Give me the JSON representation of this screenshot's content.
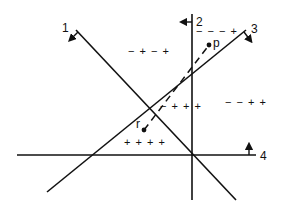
{
  "diagram": {
    "type": "line-arrangement",
    "colors": {
      "stroke": "#111111",
      "background": "#ffffff"
    },
    "lines": [
      {
        "id": "1",
        "label": "1",
        "x1": 76,
        "y1": 30,
        "x2": 236,
        "y2": 200,
        "label_x": 62,
        "label_y": 32,
        "arrow": "down-left"
      },
      {
        "id": "2",
        "label": "2",
        "x1": 192,
        "y1": 14,
        "x2": 192,
        "y2": 200,
        "label_x": 196,
        "label_y": 26,
        "arrow": "left"
      },
      {
        "id": "3",
        "label": "3",
        "x1": 47,
        "y1": 192,
        "x2": 246,
        "y2": 30,
        "label_x": 251,
        "label_y": 33,
        "arrow": "down-right"
      },
      {
        "id": "4",
        "label": "4",
        "x1": 17,
        "y1": 155,
        "x2": 256,
        "y2": 155,
        "label_x": 260,
        "label_y": 160,
        "arrow": "up"
      }
    ],
    "points": [
      {
        "id": "p",
        "label": "p",
        "x": 209,
        "y": 45,
        "label_x": 213,
        "label_y": 47
      },
      {
        "id": "r",
        "label": "r",
        "x": 144,
        "y": 130,
        "label_x": 136,
        "label_y": 128
      }
    ],
    "segment": {
      "from": "r",
      "to": "p",
      "style": "dashed"
    },
    "region_labels": [
      {
        "text": "− + − +",
        "x": 128,
        "y": 55
      },
      {
        "text": "− − − +",
        "x": 196,
        "y": 35
      },
      {
        "text": "− + + +",
        "x": 160,
        "y": 110
      },
      {
        "text": "− − + +",
        "x": 225,
        "y": 106
      },
      {
        "text": "+ + + +",
        "x": 124,
        "y": 146
      }
    ]
  }
}
